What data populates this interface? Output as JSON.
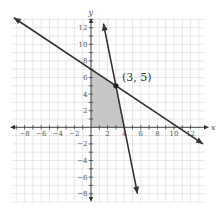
{
  "chart_data": {
    "type": "line",
    "title": "",
    "xlabel": "x",
    "ylabel": "y",
    "xlim": [
      -9,
      12.5
    ],
    "ylim": [
      -9,
      13
    ],
    "grid": true,
    "x_ticks": [
      -8,
      -6,
      -4,
      -2,
      2,
      4,
      6,
      8,
      10,
      12
    ],
    "y_ticks": [
      -8,
      -6,
      -4,
      -2,
      2,
      4,
      6,
      8,
      10,
      12
    ],
    "series": [
      {
        "name": "line-1",
        "equation": "y = -2/3 x + 7",
        "slope": -0.6667,
        "intercept": 7,
        "x_range": [
          -9.3,
          13.5
        ],
        "arrows": "both",
        "color": "#333333"
      },
      {
        "name": "line-2",
        "equation": "y = -5x + 20",
        "slope": -5,
        "intercept": 20,
        "x_range": [
          1.5,
          5.6
        ],
        "arrows": "both",
        "color": "#333333"
      }
    ],
    "shaded_region": {
      "description": "feasible region bounded by axes and both lines",
      "vertices": [
        [
          0,
          0
        ],
        [
          0,
          7
        ],
        [
          3,
          5
        ],
        [
          4,
          0
        ]
      ],
      "color": "#bbbbbb"
    },
    "points": [
      {
        "x": 3,
        "y": 5,
        "label": "(3, 5)"
      }
    ]
  }
}
